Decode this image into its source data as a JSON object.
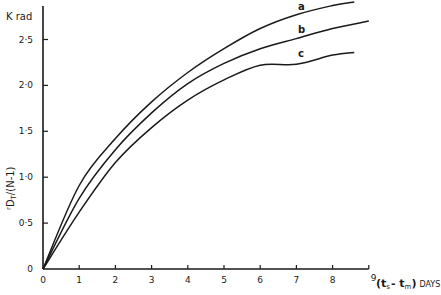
{
  "chart_data": {
    "type": "line",
    "title": "",
    "ylabel_unit": "K rad",
    "ylabel": "rDT/(N-1)",
    "ylabel_parts": {
      "pre": "r",
      "main": "D",
      "sub": "T",
      "post": "/(N-1)"
    },
    "xlabel": "(ts - tm) DAYS",
    "xlabel_parts": {
      "open": "(t",
      "sub1": "s",
      "mid": "- t",
      "sub2": "m",
      "close": ")",
      "unit": "DAYS"
    },
    "xlim": [
      0,
      9
    ],
    "ylim": [
      0,
      2.5
    ],
    "x_ticks": [
      "0",
      "1",
      "2",
      "3",
      "4",
      "5",
      "6",
      "7",
      "8",
      "9"
    ],
    "y_ticks": [
      "0",
      "0·5",
      "1·0",
      "1·5",
      "2·0",
      "2·5"
    ],
    "y_tick_values": [
      0,
      0.5,
      1.0,
      1.5,
      2.0,
      2.5
    ],
    "grid": false,
    "legend": "inline curve labels near right ends",
    "series": [
      {
        "name": "a",
        "x": [
          0,
          1,
          2,
          3,
          4,
          5,
          6,
          7,
          8,
          8.6
        ],
        "values": [
          0,
          0.91,
          1.42,
          1.82,
          2.14,
          2.4,
          2.62,
          2.77,
          2.87,
          2.91
        ]
      },
      {
        "name": "b",
        "x": [
          0,
          1,
          2,
          3,
          4,
          5,
          6,
          7,
          8,
          9.0
        ],
        "values": [
          0,
          0.77,
          1.3,
          1.7,
          2.02,
          2.24,
          2.4,
          2.51,
          2.62,
          2.7
        ]
      },
      {
        "name": "c",
        "x": [
          0,
          1,
          2,
          3,
          4,
          5,
          6,
          7,
          8,
          8.6
        ],
        "values": [
          0,
          0.62,
          1.16,
          1.54,
          1.84,
          2.06,
          2.22,
          2.23,
          2.33,
          2.36
        ]
      }
    ]
  }
}
